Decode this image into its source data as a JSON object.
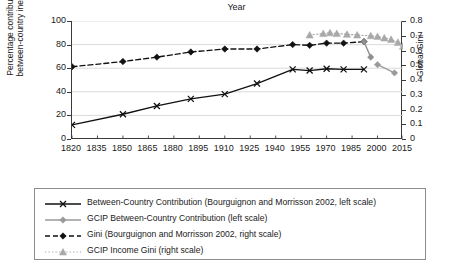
{
  "chart_data": {
    "type": "line",
    "title": "",
    "xlabel": "Year",
    "ylabel": "Percentage contribution of between-country inequality",
    "ylabel_line1": "Percentage contribution of",
    "ylabel_line2": "between-country inequality",
    "y2label": "Global Gini",
    "xlim": [
      1820,
      2015
    ],
    "ylim": [
      0,
      100
    ],
    "y2lim": [
      0,
      0.8
    ],
    "grid": "horizontal",
    "legend_position": "below",
    "xticks": [
      1820,
      1835,
      1850,
      1865,
      1880,
      1895,
      1910,
      1925,
      1940,
      1955,
      1970,
      1985,
      2000,
      2015
    ],
    "yticks_left": [
      0,
      20,
      40,
      60,
      80,
      100
    ],
    "yticks_right": [
      "0",
      "0.1",
      "0.2",
      "0.3",
      "0.4",
      "0.5",
      "0.6",
      "0.7",
      "0.8"
    ],
    "series": [
      {
        "name": "Between-Country Contribution (Bourguignon and Morrisson 2002, left scale)",
        "short_name": "Between-Country Contribution (B&M 2002)",
        "axis": "left",
        "color": "#111111",
        "marker": "x",
        "line": "solid",
        "x": [
          1820,
          1850,
          1870,
          1890,
          1910,
          1929,
          1950,
          1960,
          1970,
          1980,
          1992
        ],
        "y": [
          12,
          21,
          28,
          34,
          38,
          47,
          59,
          58,
          59.5,
          59,
          59
        ]
      },
      {
        "name": "GCIP Between-Country Contribution (left scale)",
        "short_name": "GCIP Between-Country Contribution",
        "axis": "left",
        "color": "#9a9a9a",
        "marker": "diamond",
        "line": "solid",
        "x": [
          2000,
          2010
        ],
        "y": [
          63,
          56
        ]
      },
      {
        "name": "Gini (Bourguignon and Morrisson 2002, right scale)",
        "short_name": "Gini (B&M 2002)",
        "axis": "right",
        "color": "#111111",
        "marker": "diamond-filled",
        "line": "dashed",
        "x": [
          1820,
          1850,
          1870,
          1890,
          1910,
          1929,
          1950,
          1960,
          1970,
          1980,
          1992
        ],
        "y": [
          0.49,
          0.525,
          0.555,
          0.59,
          0.61,
          0.61,
          0.64,
          0.635,
          0.65,
          0.65,
          0.66
        ]
      },
      {
        "name": "GCIP Income Gini (right scale)",
        "short_name": "GCIP Income Gini",
        "axis": "right",
        "color": "#a8a8a8",
        "marker": "triangle",
        "line": "dotted",
        "x": [
          1960,
          1968,
          1972,
          1976,
          1982,
          1988,
          1996,
          2000,
          2004,
          2008,
          2012,
          2015
        ],
        "y": [
          0.705,
          0.715,
          0.72,
          0.715,
          0.71,
          0.705,
          0.7,
          0.695,
          0.685,
          0.675,
          0.655,
          0.63
        ]
      },
      {
        "name": "GCIP between-country descending segment",
        "short_name": "GCIP between-country segment",
        "axis": "right",
        "color": "#8f8f8f",
        "marker": "diamond",
        "line": "solid",
        "x": [
          1992,
          1996
        ],
        "y": [
          0.66,
          0.555
        ]
      }
    ]
  },
  "legend": {
    "items": [
      {
        "label": "Between-Country Contribution (Bourguignon and Morrisson 2002, left scale)",
        "marker": "x",
        "line": "solid",
        "color": "#111111"
      },
      {
        "label": "GCIP Between-Country Contribution (left scale)",
        "marker": "diamond",
        "line": "solid",
        "color": "#9a9a9a"
      },
      {
        "label": "Gini (Bourguignon and Morrisson 2002, right scale)",
        "marker": "diamond-filled",
        "line": "dashed",
        "color": "#111111"
      },
      {
        "label": "GCIP Income Gini (right scale)",
        "marker": "triangle",
        "line": "dotted",
        "color": "#a8a8a8"
      }
    ]
  },
  "colors": {
    "axis": "#3a3a3a",
    "grid": "#d6d6d6",
    "dark_series": "#111111",
    "gray_series": "#9a9a9a",
    "text": "#1a1a1a"
  }
}
